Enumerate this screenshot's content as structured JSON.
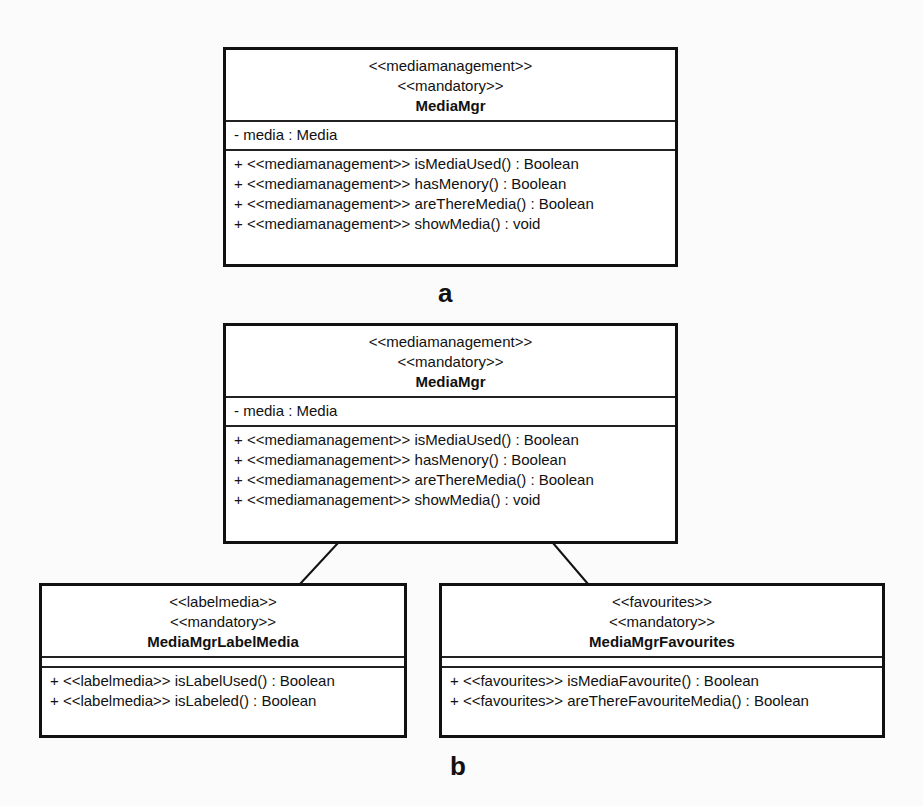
{
  "diagram_a": {
    "label": "a",
    "class": {
      "stereotypes": [
        "<<mediamanagement>>",
        "<<mandatory>>"
      ],
      "name": "MediaMgr",
      "attributes": [
        "- media : Media"
      ],
      "operations": [
        "+ <<mediamanagement>> isMediaUsed() : Boolean",
        "+ <<mediamanagement>> hasMenory() : Boolean",
        "+ <<mediamanagement>> areThereMedia() : Boolean",
        "+ <<mediamanagement>> showMedia() : void"
      ]
    }
  },
  "diagram_b": {
    "label": "b",
    "parent": {
      "stereotypes": [
        "<<mediamanagement>>",
        "<<mandatory>>"
      ],
      "name": "MediaMgr",
      "attributes": [
        "- media : Media"
      ],
      "operations": [
        "+ <<mediamanagement>> isMediaUsed() : Boolean",
        "+ <<mediamanagement>> hasMenory() : Boolean",
        "+ <<mediamanagement>> areThereMedia() : Boolean",
        "+ <<mediamanagement>> showMedia() : void"
      ]
    },
    "children": [
      {
        "stereotypes": [
          "<<labelmedia>>",
          "<<mandatory>>"
        ],
        "name": "MediaMgrLabelMedia",
        "attributes": [],
        "operations": [
          "+ <<labelmedia>> isLabelUsed() : Boolean",
          "+ <<labelmedia>> isLabeled() : Boolean"
        ]
      },
      {
        "stereotypes": [
          "<<favourites>>",
          "<<mandatory>>"
        ],
        "name": "MediaMgrFavourites",
        "attributes": [],
        "operations": [
          "+ <<favourites>> isMediaFavourite() : Boolean",
          "+ <<favourites>> areThereFavouriteMedia() : Boolean"
        ]
      }
    ],
    "associations": [
      {
        "from": "MediaMgr",
        "to": "MediaMgrLabelMedia"
      },
      {
        "from": "MediaMgr",
        "to": "MediaMgrFavourites"
      }
    ]
  }
}
